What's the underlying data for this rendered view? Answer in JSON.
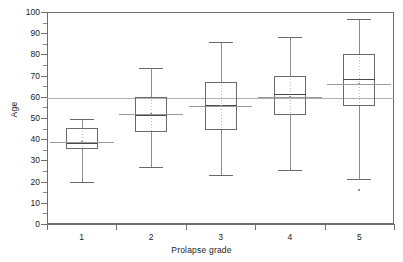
{
  "chart_data": {
    "type": "box",
    "title": "",
    "xlabel": "Prolapse grade",
    "ylabel": "Age",
    "categories": [
      "1",
      "2",
      "3",
      "4",
      "5"
    ],
    "ylim": [
      0,
      100
    ],
    "ytick_labels": [
      "0",
      "10",
      "20",
      "30",
      "40",
      "50",
      "60",
      "70",
      "80",
      "90",
      "100"
    ],
    "ytick_values": [
      0,
      10,
      20,
      30,
      40,
      50,
      60,
      70,
      80,
      90,
      100
    ],
    "ytick_step": 10,
    "grid": false,
    "legend": "none",
    "boxes": [
      {
        "category": "1",
        "min": 20.0,
        "q1": 35.5,
        "median": 38.0,
        "q3": 45.5,
        "max": 49.5,
        "mean": 38.5
      },
      {
        "category": "2",
        "min": 27.0,
        "q1": 43.5,
        "median": 51.5,
        "q3": 60.0,
        "max": 73.5,
        "mean": 52.0
      },
      {
        "category": "3",
        "min": 23.0,
        "q1": 44.5,
        "median": 56.0,
        "q3": 67.0,
        "max": 86.0,
        "mean": 55.5
      },
      {
        "category": "4",
        "min": 25.5,
        "q1": 51.5,
        "median": 61.5,
        "q3": 70.0,
        "max": 88.0,
        "mean": 60.0
      },
      {
        "category": "5",
        "min": 21.0,
        "q1": 55.5,
        "median": 68.5,
        "q3": 80.0,
        "max": 96.5,
        "mean": 66.0
      }
    ],
    "outliers": [
      {
        "category": "5",
        "value": 16.0
      }
    ],
    "reference_line": {
      "label": "overall mean",
      "value": 59.5
    },
    "colors": {
      "axis": "#6e6e6e",
      "box_outline": "#6a6a6a",
      "whisker": "#8d8d8d",
      "median": "#4a4a4a",
      "reference_line": "#b0b0b0",
      "group_mean_line": "#9b9b9b",
      "background": "#ffffff",
      "text": "#1a1a1a"
    }
  }
}
